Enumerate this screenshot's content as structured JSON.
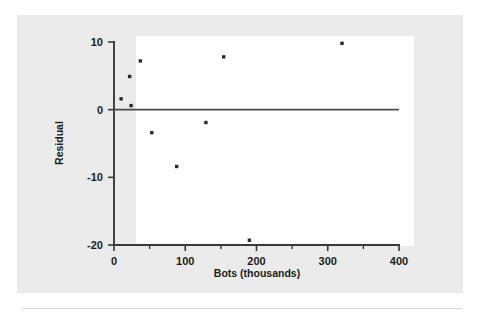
{
  "figure": {
    "background_color": "#ebebeb",
    "plot_background_color": "#ffffff",
    "axis_color": "#3a3a3a",
    "point_color": "#2b2b2b"
  },
  "chart_data": {
    "type": "scatter",
    "title": "",
    "xlabel": "Bots (thousands)",
    "ylabel": "Residual",
    "xlim": [
      0,
      400
    ],
    "ylim": [
      -20,
      10
    ],
    "xticks": [
      0,
      100,
      200,
      300,
      400
    ],
    "xtick_labels": [
      "0",
      "100",
      "200",
      "300",
      "400"
    ],
    "xminor_ticks": [
      50,
      150,
      250,
      350
    ],
    "yticks": [
      10,
      0,
      -10,
      -20
    ],
    "ytick_labels": [
      "10",
      "0",
      "-10",
      "-20"
    ],
    "grid": false,
    "legend": null,
    "reference_line": {
      "y": 0,
      "label": "zero residual line"
    },
    "points": [
      {
        "x": 10,
        "y": 1.6
      },
      {
        "x": 22,
        "y": 4.9
      },
      {
        "x": 24,
        "y": 0.6
      },
      {
        "x": 37,
        "y": 7.2
      },
      {
        "x": 53,
        "y": -3.4
      },
      {
        "x": 88,
        "y": -8.4
      },
      {
        "x": 129,
        "y": -1.9
      },
      {
        "x": 154,
        "y": 7.8
      },
      {
        "x": 190,
        "y": -19.3
      },
      {
        "x": 320,
        "y": 9.8
      }
    ]
  }
}
